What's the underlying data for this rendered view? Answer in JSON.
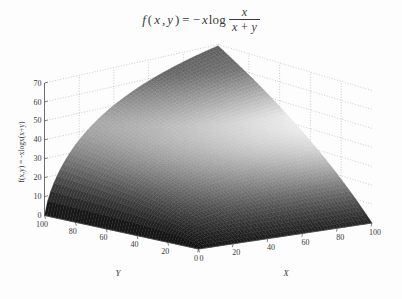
{
  "figure": {
    "title_parts": {
      "f": "f",
      "open": "(",
      "x": "x",
      "comma": ",",
      "y": "y",
      "close": ")",
      "equals": "=",
      "minus": "−",
      "x2": "x",
      "log": "log",
      "numerator": "x",
      "denominator": "x + y"
    },
    "title_text": "f(x,y) = −x log x/(x+y)",
    "background_color": "#fdfdfd",
    "surface_color_dark": "#1a1a1a",
    "surface_color_light": "#f2f2f2",
    "grid_color": "#9a9a9a",
    "axis_color": "#4a4a4a"
  },
  "axes": {
    "x": {
      "label": "X",
      "ticks": [
        0,
        20,
        40,
        60,
        80,
        100
      ],
      "tick_labels": [
        "0",
        "20",
        "40",
        "60",
        "80",
        "100"
      ],
      "range": [
        0,
        100
      ]
    },
    "y": {
      "label": "Y",
      "ticks": [
        0,
        20,
        40,
        60,
        80,
        100
      ],
      "tick_labels": [
        "0",
        "20",
        "40",
        "60",
        "80",
        "100"
      ],
      "range": [
        0,
        100
      ]
    },
    "z": {
      "label": "f(x,y) = -xlogx(x+y)",
      "ticks": [
        0,
        10,
        20,
        30,
        40,
        50,
        60,
        70
      ],
      "tick_labels": [
        "0",
        "10",
        "20",
        "30",
        "40",
        "50",
        "60",
        "70"
      ],
      "range": [
        0,
        70
      ]
    }
  },
  "chart_data": {
    "type": "surface",
    "xlabel": "X",
    "ylabel": "Y",
    "zlabel": "f(x,y) = -xlogx(x+y)",
    "xlim": [
      0,
      100
    ],
    "ylim": [
      0,
      100
    ],
    "zlim": [
      0,
      70
    ],
    "xticks": [
      0,
      20,
      40,
      60,
      80,
      100
    ],
    "yticks": [
      0,
      20,
      40,
      60,
      80,
      100
    ],
    "zticks": [
      0,
      10,
      20,
      30,
      40,
      50,
      60,
      70
    ],
    "grid": true,
    "legend": null,
    "formula": "z = -x * log(x / (x + y))",
    "mesh_resolution": {
      "nx": 56,
      "ny": 56
    },
    "shading": "grayscale-dither",
    "view": {
      "azimuth_deg": -37.5,
      "elevation_deg": 26
    },
    "peak": {
      "x": 100,
      "y": 100,
      "z": 69.3
    },
    "sample_points": [
      {
        "x": 0,
        "y": 0,
        "z": 0.0
      },
      {
        "x": 20,
        "y": 0,
        "z": 0.0
      },
      {
        "x": 40,
        "y": 0,
        "z": 0.0
      },
      {
        "x": 60,
        "y": 0,
        "z": 0.0
      },
      {
        "x": 80,
        "y": 0,
        "z": 0.0
      },
      {
        "x": 100,
        "y": 0,
        "z": 0.0
      },
      {
        "x": 20,
        "y": 20,
        "z": 13.9
      },
      {
        "x": 20,
        "y": 60,
        "z": 27.7
      },
      {
        "x": 20,
        "y": 100,
        "z": 35.8
      },
      {
        "x": 40,
        "y": 20,
        "z": 16.2
      },
      {
        "x": 40,
        "y": 60,
        "z": 36.6
      },
      {
        "x": 40,
        "y": 100,
        "z": 51.1
      },
      {
        "x": 60,
        "y": 20,
        "z": 17.0
      },
      {
        "x": 60,
        "y": 60,
        "z": 41.6
      },
      {
        "x": 60,
        "y": 100,
        "z": 61.3
      },
      {
        "x": 80,
        "y": 20,
        "z": 17.8
      },
      {
        "x": 80,
        "y": 60,
        "z": 44.9
      },
      {
        "x": 80,
        "y": 100,
        "z": 68.4
      },
      {
        "x": 100,
        "y": 20,
        "z": 18.2
      },
      {
        "x": 100,
        "y": 60,
        "z": 47.0
      },
      {
        "x": 100,
        "y": 100,
        "z": 69.3
      }
    ]
  }
}
